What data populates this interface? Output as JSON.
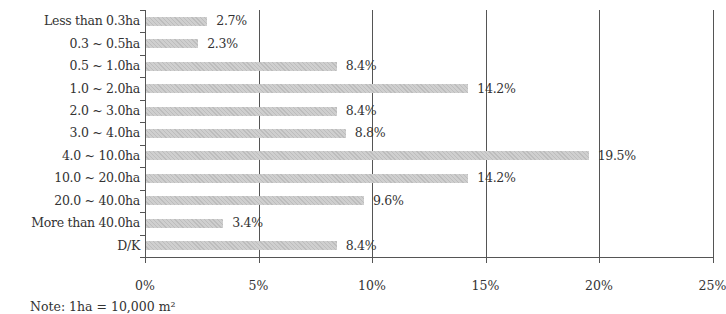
{
  "chart_data": {
    "type": "bar",
    "orientation": "horizontal",
    "title": "",
    "xlabel": "",
    "ylabel": "",
    "categories": [
      "Less than 0.3ha",
      "0.3 ~ 0.5ha",
      "0.5 ~ 1.0ha",
      "1.0 ~ 2.0ha",
      "2.0 ~ 3.0ha",
      "3.0 ~ 4.0ha",
      "4.0 ~ 10.0ha",
      "10.0 ~ 20.0ha",
      "20.0 ~ 40.0ha",
      "More than 40.0ha",
      "D/K"
    ],
    "values": [
      2.7,
      2.3,
      8.4,
      14.2,
      8.4,
      8.8,
      19.5,
      14.2,
      9.6,
      3.4,
      8.4
    ],
    "value_labels": [
      "2.7%",
      "2.3%",
      "8.4%",
      "14.2%",
      "8.4%",
      "8.8%",
      "19.5%",
      "14.2%",
      "9.6%",
      "3.4%",
      "8.4%"
    ],
    "xlim": [
      0,
      25
    ],
    "xticks": [
      "0%",
      "5%",
      "10%",
      "15%",
      "20%",
      "25%"
    ],
    "grid": "vertical",
    "legend": "none",
    "bar_color": "#c6c6c6",
    "note": "Note: 1ha = 10,000 m²"
  }
}
